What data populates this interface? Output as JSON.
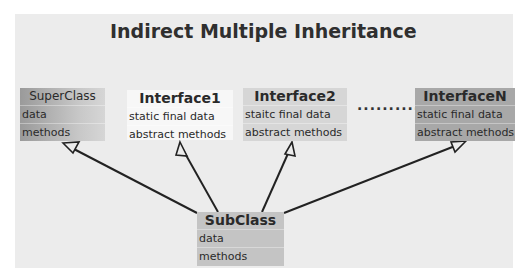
{
  "title": "Indirect Multiple Inheritance",
  "separator": "..........",
  "boxes": {
    "superclass": {
      "name": "SuperClass",
      "rows": [
        "data",
        "methods"
      ]
    },
    "interface1": {
      "name": "Interface1",
      "rows": [
        "static final data",
        "abstract methods"
      ]
    },
    "interface2": {
      "name": "Interface2",
      "rows": [
        "staitc final data",
        "abstract methods"
      ]
    },
    "interfaceN": {
      "name": "InterfaceN",
      "rows": [
        "static final data",
        "abstract methods"
      ]
    },
    "subclass": {
      "name": "SubClass",
      "rows": [
        "data",
        "methods"
      ]
    }
  },
  "relations": [
    {
      "from": "SubClass",
      "to": "SuperClass",
      "type": "inheritance"
    },
    {
      "from": "SubClass",
      "to": "Interface1",
      "type": "inheritance"
    },
    {
      "from": "SubClass",
      "to": "Interface2",
      "type": "inheritance"
    },
    {
      "from": "SubClass",
      "to": "InterfaceN",
      "type": "inheritance"
    }
  ]
}
